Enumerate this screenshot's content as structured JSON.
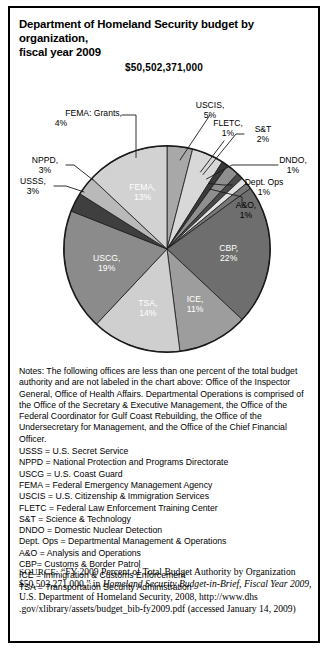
{
  "figure": {
    "title_line1": "Department of Homeland Security budget by organization,",
    "title_line2": "fiscal year 2009",
    "total_label": "$50,502,371,000"
  },
  "chart_data": {
    "type": "pie",
    "title": "Department of Homeland Security budget by organization, fiscal year 2009",
    "subtitle": "$50,502,371,000",
    "total": "$50,502,371,000",
    "unit": "percent of total budget authority",
    "legend": "none",
    "start_angle_deg": 0,
    "direction": "clockwise",
    "categories": [
      "FEMA: Grants",
      "USCIS",
      "FLETC",
      "S&T",
      "DNDO",
      "Dept. Ops",
      "A&O",
      "CBP",
      "ICE",
      "TSA",
      "USCG",
      "USSS",
      "NPPD",
      "FEMA"
    ],
    "values": [
      4,
      5,
      1,
      2,
      1,
      1,
      1,
      22,
      11,
      14,
      19,
      3,
      3,
      13
    ],
    "slices": [
      {
        "name": "FEMA: Grants",
        "value": 4,
        "label": "FEMA: Grants,",
        "pct_label": "4%",
        "color": "#a8a8a8",
        "label_placement": "callout"
      },
      {
        "name": "USCIS",
        "value": 5,
        "label": "USCIS,",
        "pct_label": "5%",
        "color": "#d8d8d8",
        "label_placement": "callout"
      },
      {
        "name": "FLETC",
        "value": 1,
        "label": "FLETC,",
        "pct_label": "1%",
        "color": "#3a3a3a",
        "label_placement": "callout"
      },
      {
        "name": "S&T",
        "value": 2,
        "label": "S&T",
        "pct_label": "2%",
        "color": "#8f8f8f",
        "label_placement": "callout"
      },
      {
        "name": "DNDO",
        "value": 1,
        "label": "DNDO,",
        "pct_label": "1%",
        "color": "#4a4a4a",
        "label_placement": "callout"
      },
      {
        "name": "Dept. Ops",
        "value": 1,
        "label": "Dept. Ops",
        "pct_label": "1%",
        "color": "#e2e2e2",
        "label_placement": "callout"
      },
      {
        "name": "A&O",
        "value": 1,
        "label": "A&O,",
        "pct_label": "1%",
        "color": "#777777",
        "label_placement": "callout"
      },
      {
        "name": "CBP",
        "value": 22,
        "label": "CBP,",
        "pct_label": "22%",
        "color": "#6e6e6e",
        "label_placement": "inside"
      },
      {
        "name": "ICE",
        "value": 11,
        "label": "ICE,",
        "pct_label": "11%",
        "color": "#9d9d9d",
        "label_placement": "inside"
      },
      {
        "name": "TSA",
        "value": 14,
        "label": "TSA,",
        "pct_label": "14%",
        "color": "#cfcfcf",
        "label_placement": "inside"
      },
      {
        "name": "USCG",
        "value": 19,
        "label": "USCG,",
        "pct_label": "19%",
        "color": "#8b8b8b",
        "label_placement": "inside"
      },
      {
        "name": "USSS",
        "value": 3,
        "label": "USSS,",
        "pct_label": "3%",
        "color": "#3f3f3f",
        "label_placement": "callout"
      },
      {
        "name": "NPPD",
        "value": 3,
        "label": "NPPD,",
        "pct_label": "3%",
        "color": "#b9b9b9",
        "label_placement": "callout"
      },
      {
        "name": "FEMA",
        "value": 13,
        "label": "FEMA,",
        "pct_label": "13%",
        "color": "#d2d2d2",
        "label_placement": "inside"
      }
    ]
  },
  "notes": {
    "paragraph": "Notes: The following offices are less than one percent of the total budget authority and are not labeled in the chart above: Office of the Inspector General, Office of Health Affairs. Departmental Operations is comprised of the Office of the Secretary & Executive Management, the Office of the Federal Coordinator for Gulf Coast Rebuilding, the Office of the Undersecretary for Management, and the Office of the Chief Financial Officer.",
    "abbreviations": [
      "USSS  =  U.S. Secret Service",
      "NPPD  =  National Protection and Programs Directorate",
      "USCG  =  U.S. Coast Guard",
      "FEMA  =  Federal Emergency Management Agency",
      "USCIS  =  U.S. Citizenship & Immigration Services",
      "FLETC  =  Federal Law Enforcement Training Center",
      "S&T  =  Science & Technology",
      "DNDO  =  Domestic Nuclear Detection",
      "Dept. Ops  =  Departmental Management & Operations",
      "A&O  =  Analysis and Operations",
      "CBP=  Customs & Border Patrol",
      "ICE  =  Immigration & Customs Enforcement",
      "TSA  =  Transportation Security Administration"
    ]
  },
  "source": {
    "label": "SOURCE:",
    "part1": " “FY 2009 Percent of Total Budget Authority by Organization $50,503,271,000,” in ",
    "italic1": "Homeland Security Budget-in-Brief, Fiscal Year 2009,",
    "part2": " U.S. Department of Homeland Security, 2008, http://www.dhs .gov/xlibrary/assets/budget_bib-fy2009.pdf (accessed January 14, 2009)"
  }
}
